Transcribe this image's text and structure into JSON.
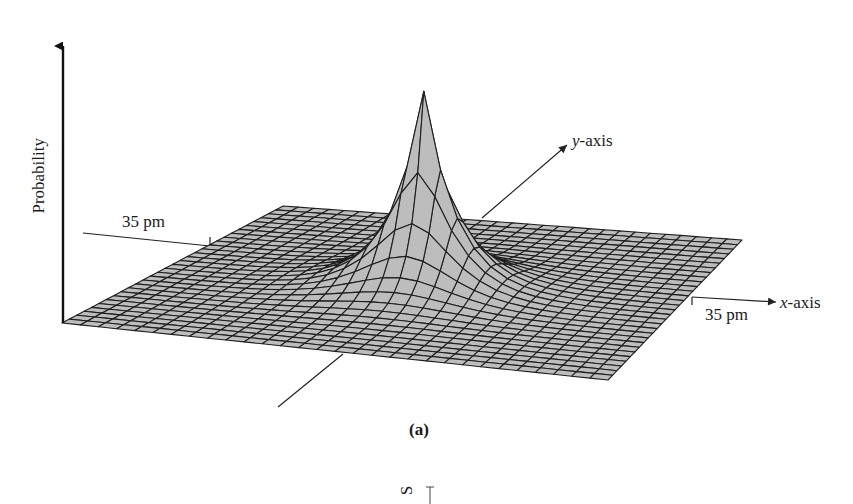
{
  "figure": {
    "caption": "(a)",
    "z_axis_label": "Probability",
    "y_axis_label_var": "y",
    "y_axis_label_suffix": "-axis",
    "x_axis_label_var": "x",
    "x_axis_label_suffix": "-axis",
    "y_scale_label": "35 pm",
    "x_scale_label": "35 pm",
    "partial_next_panel_glyph": "S"
  },
  "surface": {
    "description": "3D wireframe probability density surface with a sharp cusp peak at origin",
    "grid_cells": 30,
    "fill_color": "#bdbdbd",
    "line_color": "#1e1e1e",
    "corners": {
      "back_left": [
        283,
        206
      ],
      "back_right": [
        742,
        240
      ],
      "front_right": [
        608,
        380
      ],
      "front_left": [
        62,
        323
      ]
    },
    "peak_apex": [
      424,
      91
    ],
    "peak_height_px": 196
  },
  "colors": {
    "background": "#ffffff",
    "axis": "#111111",
    "text": "#1a1a1a"
  }
}
